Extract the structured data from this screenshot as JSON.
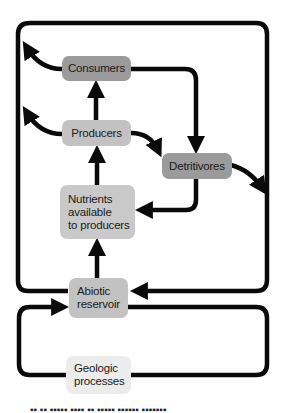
{
  "diagram": {
    "type": "nutrient-cycle-flow",
    "nodes": [
      {
        "id": "consumers",
        "label": "Consumers",
        "color": "#9b9b9b"
      },
      {
        "id": "producers",
        "label": "Producers",
        "color": "#c2c2c2"
      },
      {
        "id": "detritivores",
        "label": "Detritivores",
        "color": "#9b9b9b"
      },
      {
        "id": "nutrients",
        "label_lines": [
          "Nutrients",
          "available",
          "to producers"
        ],
        "color": "#c9c9c9"
      },
      {
        "id": "abiotic",
        "label_lines": [
          "Abiotic",
          "reservoir"
        ],
        "color": "#c2c2c2"
      },
      {
        "id": "geologic",
        "label_lines": [
          "Geologic",
          "processes"
        ],
        "color": "#ececec"
      }
    ],
    "edges": [
      {
        "from": "producers",
        "to": "consumers"
      },
      {
        "from": "consumers",
        "to": "detritivores"
      },
      {
        "from": "producers",
        "to": "detritivores"
      },
      {
        "from": "detritivores",
        "to": "nutrients"
      },
      {
        "from": "nutrients",
        "to": "producers"
      },
      {
        "from": "abiotic",
        "to": "nutrients"
      },
      {
        "from": "consumers",
        "to": "abiotic",
        "via": "outer loop (left curl arrow)"
      },
      {
        "from": "producers",
        "to": "abiotic",
        "via": "outer loop (left curl arrow)"
      },
      {
        "from": "detritivores",
        "to": "abiotic",
        "via": "outer loop (right arrow)"
      },
      {
        "from": "abiotic",
        "to": "geologic",
        "via": "lower loop"
      },
      {
        "from": "geologic",
        "to": "abiotic",
        "via": "lower loop"
      }
    ],
    "line_color": "#0a0a0a"
  },
  "caption": {
    "text": "▪▪ ▪▪ ▪▪▪▪▪ ▪▪▪▪ ▪▪ ▪▪▪▪▪ ▪▪▪▪▪▪ ▪▪▪▪▪▪▪"
  }
}
